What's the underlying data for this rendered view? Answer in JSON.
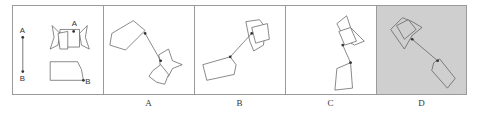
{
  "figure": {
    "type": "spatial-reasoning-puzzle",
    "stimulus": {
      "segment_labels": [
        "A",
        "B"
      ],
      "shape_point_labels": [
        "A",
        "B"
      ]
    },
    "options": [
      {
        "label": "A",
        "selected": false
      },
      {
        "label": "B",
        "selected": false
      },
      {
        "label": "C",
        "selected": false
      },
      {
        "label": "D",
        "selected": true
      }
    ],
    "colors": {
      "border": "#9a9a9a",
      "line": "#555555",
      "selected_background": "#cfcfcf"
    }
  }
}
